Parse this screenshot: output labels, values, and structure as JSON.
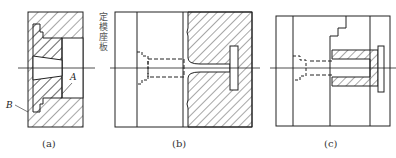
{
  "figure": {
    "panels": [
      {
        "id": "a",
        "caption": "(a)",
        "labels": [
          "A",
          "B"
        ]
      },
      {
        "id": "b",
        "caption": "(b)",
        "side_label": "定模座板"
      },
      {
        "id": "c",
        "caption": "(c)"
      }
    ],
    "colors": {
      "line": "#222222",
      "background": "#ffffff"
    }
  }
}
